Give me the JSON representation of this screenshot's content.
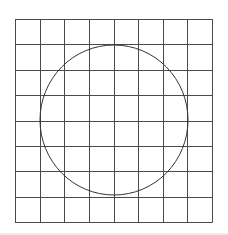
{
  "figure": {
    "grid": {
      "columns": 8,
      "rows": 8,
      "x0": 15,
      "y0": 19,
      "x1": 212,
      "y1": 222,
      "line_color": "#4a4a4a"
    },
    "circle": {
      "cx": 114,
      "cy": 120,
      "rx": 74,
      "ry": 75,
      "stroke_color": "#333333"
    },
    "footer_rule_color": "#d8d8d8"
  }
}
